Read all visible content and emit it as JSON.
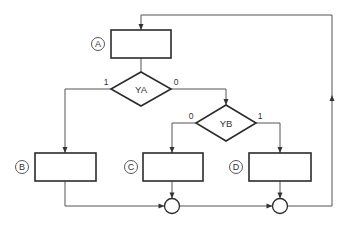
{
  "diagram": {
    "type": "flowchart",
    "colors": {
      "line": "#555555",
      "shape": "#2b2b2b",
      "text": "#333333",
      "background": "#ffffff"
    },
    "process_blocks": [
      {
        "id": "A",
        "label": "A",
        "x": 111,
        "y": 30,
        "w": 60,
        "h": 28,
        "badge": {
          "cx": 98,
          "cy": 44
        }
      },
      {
        "id": "B",
        "label": "B",
        "x": 35,
        "y": 153,
        "w": 61,
        "h": 28,
        "badge": {
          "cx": 22,
          "cy": 167
        }
      },
      {
        "id": "C",
        "label": "C",
        "x": 143,
        "y": 153,
        "w": 60,
        "h": 28,
        "badge": {
          "cx": 131,
          "cy": 167
        }
      },
      {
        "id": "D",
        "label": "D",
        "x": 249,
        "y": 153,
        "w": 62,
        "h": 28,
        "badge": {
          "cx": 236,
          "cy": 167
        }
      }
    ],
    "decisions": [
      {
        "id": "YA",
        "label": "YA",
        "cx": 141,
        "cy": 89,
        "hw": 30,
        "hh": 17,
        "branch_left_label": "1",
        "branch_right_label": "0"
      },
      {
        "id": "YB",
        "label": "YB",
        "cx": 226,
        "cy": 123,
        "hw": 30,
        "hh": 18,
        "branch_left_label": "0",
        "branch_right_label": "1"
      }
    ],
    "junctions": [
      {
        "id": "J1",
        "cx": 172,
        "cy": 206,
        "r": 7.5
      },
      {
        "id": "J2",
        "cx": 280,
        "cy": 206,
        "r": 7.5
      }
    ],
    "connections": [
      {
        "from": "A",
        "to": "YA"
      },
      {
        "from": "YA",
        "to": "B",
        "branch": "1"
      },
      {
        "from": "YA",
        "to": "YB",
        "branch": "0"
      },
      {
        "from": "YB",
        "to": "C",
        "branch": "0"
      },
      {
        "from": "YB",
        "to": "D",
        "branch": "1"
      },
      {
        "from": "B",
        "to": "J1"
      },
      {
        "from": "C",
        "to": "J1"
      },
      {
        "from": "J1",
        "to": "J2"
      },
      {
        "from": "D",
        "to": "J2"
      },
      {
        "from": "J2",
        "to": "A",
        "note": "feedback loop"
      }
    ]
  }
}
